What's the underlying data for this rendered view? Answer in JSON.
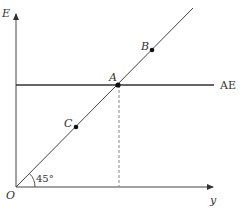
{
  "diagram": {
    "axes": {
      "y_axis_label": "E",
      "x_axis_label": "y",
      "origin_label": "O"
    },
    "lines": {
      "ae_label": "AE",
      "angle_label": "45°"
    },
    "points": {
      "a_label": "A",
      "b_label": "B",
      "c_label": "C"
    },
    "colors": {
      "line": "#333333",
      "dashed": "#888888",
      "background": "#ffffff"
    }
  }
}
